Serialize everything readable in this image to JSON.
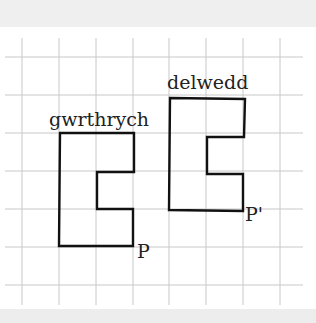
{
  "diagram": {
    "type": "grid-translation",
    "grid": {
      "vertical_x": [
        22,
        59,
        96,
        133,
        169,
        206,
        243,
        280
      ],
      "horizontal_y": [
        57,
        95,
        133,
        171,
        209,
        247,
        285
      ],
      "x_extent": [
        5,
        303
      ],
      "y_extent": [
        38,
        305
      ],
      "color": "#c8c8c8"
    },
    "shapes": [
      {
        "name": "object",
        "label": "gwrthrych",
        "label_pos": [
          49,
          126
        ],
        "points": "60,133 134,133 134,172 97,172 97,209 133,209 133,246 59,246",
        "point_label": "P",
        "point_label_pos": [
          137,
          258
        ]
      },
      {
        "name": "image",
        "label": "delwedd",
        "label_pos": [
          167,
          89
        ],
        "points": "170,98 245,99 244,137 207,137 207,174 243,174 243,211 169,210",
        "point_label": "P'",
        "point_label_pos": [
          245,
          221
        ]
      }
    ],
    "stroke_color": "#111111"
  }
}
